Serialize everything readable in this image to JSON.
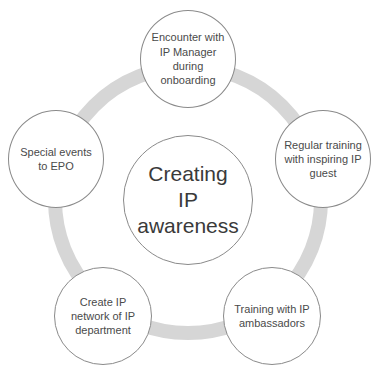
{
  "diagram": {
    "type": "cycle",
    "ring_color": "#d6d6d6",
    "center": {
      "label": "Creating IP awareness",
      "lines": [
        "Creating",
        "IP",
        "awareness"
      ]
    },
    "nodes": [
      {
        "label": "Encounter with IP Manager during onboarding"
      },
      {
        "label": "Regular training with inspiring IP guest"
      },
      {
        "label": "Special events to EPO"
      },
      {
        "label": "Create IP network of IP department"
      },
      {
        "label": "Training with IP ambassadors"
      }
    ]
  }
}
